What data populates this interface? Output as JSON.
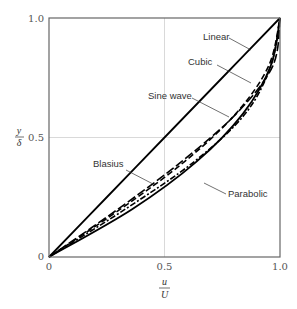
{
  "chart_data": {
    "type": "line",
    "title": "",
    "xlabel": "u/U",
    "ylabel": "y/δ",
    "xlim": [
      0,
      1.0
    ],
    "ylim": [
      0,
      1.0
    ],
    "xticks": [
      "0",
      "0.5",
      "1.0"
    ],
    "yticks": [
      "0",
      "0.5",
      "1.0"
    ],
    "grid": {
      "x": [
        0.5
      ],
      "y": [
        0.5
      ]
    },
    "legend": "annotations with leader lines",
    "series": [
      {
        "name": "Linear",
        "style": "solid",
        "x": [
          0,
          0.25,
          0.5,
          0.75,
          1.0
        ],
        "y": [
          0,
          0.25,
          0.5,
          0.75,
          1.0
        ]
      },
      {
        "name": "Cubic",
        "style": "long-dash",
        "x": [
          0,
          0.298,
          0.575,
          0.811,
          0.969,
          1.0
        ],
        "y": [
          0,
          0.2,
          0.4,
          0.6,
          0.8,
          1.0
        ]
      },
      {
        "name": "Sine wave",
        "style": "dash",
        "x": [
          0,
          0.309,
          0.588,
          0.809,
          0.951,
          1.0
        ],
        "y": [
          0,
          0.2,
          0.4,
          0.6,
          0.8,
          1.0
        ]
      },
      {
        "name": "Blasius",
        "style": "dash-dot",
        "x": [
          0,
          0.33,
          0.63,
          0.85,
          0.96,
          1.0
        ],
        "y": [
          0,
          0.2,
          0.4,
          0.6,
          0.8,
          1.0
        ]
      },
      {
        "name": "Parabolic",
        "style": "solid",
        "x": [
          0,
          0.36,
          0.64,
          0.84,
          0.96,
          1.0
        ],
        "y": [
          0,
          0.2,
          0.4,
          0.6,
          0.8,
          1.0
        ]
      }
    ],
    "annotations": [
      "Linear",
      "Cubic",
      "Sine wave",
      "Blasius",
      "Parabolic"
    ]
  },
  "axes": {
    "x_label_num": "u",
    "x_label_den": "U",
    "y_label_num": "y",
    "y_label_den": "δ",
    "x_ticks": [
      "0",
      "0.5",
      "1.0"
    ],
    "y_ticks": [
      "0",
      "0.5",
      "1.0"
    ]
  },
  "labels": {
    "linear": "Linear",
    "cubic": "Cubic",
    "sine": "Sine wave",
    "blasius": "Blasius",
    "parabolic": "Parabolic"
  }
}
